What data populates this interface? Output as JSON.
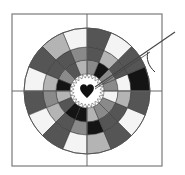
{
  "palette": {
    "white": "#f4f4f4",
    "light": "#b4b4b4",
    "gray": "#8a8a8a",
    "dark": "#555555",
    "black": "#141414",
    "line": "#6a6a6a",
    "heart": "#111111",
    "frame": "#7a7a7a"
  },
  "pattern": {
    "wedge_count": 16,
    "rings": [
      "inner",
      "middle",
      "outer"
    ],
    "wedges": [
      {
        "inner": "gray",
        "middle": "white",
        "outer": "black"
      },
      {
        "inner": "gray",
        "middle": "dark",
        "outer": "dark"
      },
      {
        "inner": "black",
        "middle": "light",
        "outer": "white"
      },
      {
        "inner": "gray",
        "middle": "dark",
        "outer": "dark"
      },
      {
        "inner": "light",
        "middle": "gray",
        "outer": "white"
      },
      {
        "inner": "dark",
        "middle": "dark",
        "outer": "light"
      },
      {
        "inner": "gray",
        "middle": "dark",
        "outer": "dark"
      },
      {
        "inner": "black",
        "middle": "light",
        "outer": "white"
      },
      {
        "inner": "light",
        "middle": "gray",
        "outer": "dark"
      },
      {
        "inner": "dark",
        "middle": "light",
        "outer": "white"
      },
      {
        "inner": "black",
        "middle": "dark",
        "outer": "dark"
      },
      {
        "inner": "black",
        "middle": "gray",
        "outer": "white"
      },
      {
        "inner": "light",
        "middle": "black",
        "outer": "light"
      },
      {
        "inner": "gray",
        "middle": "dark",
        "outer": "dark"
      },
      {
        "inner": "gray",
        "middle": "dark",
        "outer": "white"
      },
      {
        "inner": "white",
        "middle": "light",
        "outer": "dark"
      }
    ]
  },
  "center_icon": "heart-icon",
  "tool_icon": "needle-icon"
}
